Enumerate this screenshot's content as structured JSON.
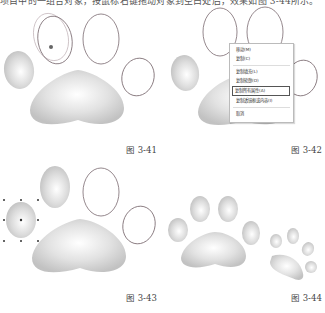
{
  "top_text": "项目中的一组合对象，按鼠标右键拖动对象到空白处后，效果如图 3-44所示。",
  "figures": [
    {
      "id": "fig-3-41",
      "caption": "图 3-41"
    },
    {
      "id": "fig-3-42",
      "caption": "图 3-42"
    },
    {
      "id": "fig-3-43",
      "caption": "图 3-43"
    },
    {
      "id": "fig-3-44",
      "caption": "图 3-44"
    }
  ],
  "context_menu": {
    "items": [
      {
        "label": "移动(M)"
      },
      {
        "label": "复制(C)"
      },
      {
        "label": "复制填充(L)"
      },
      {
        "label": "复制轮廓(O)"
      },
      {
        "label": "复制所有属性(A)",
        "selected": true
      },
      {
        "label": "复制透镜框或内容(I)"
      },
      {
        "label": "取消"
      }
    ]
  },
  "colors": {
    "fill_light": "#ffffff",
    "fill_dark": "#c4c4c4",
    "outline": "#8a7a80",
    "menu_border": "#bbbbbb"
  }
}
